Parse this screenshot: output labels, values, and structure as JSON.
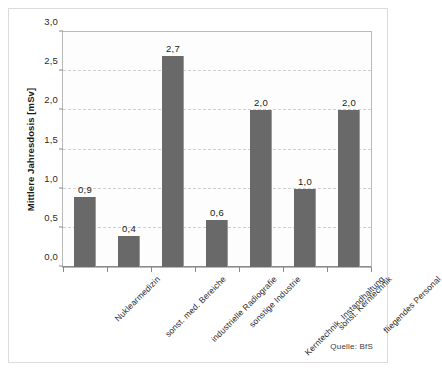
{
  "chart_data": {
    "type": "bar",
    "title": "",
    "xlabel": "",
    "ylabel": "Mittlere Jahresdosis [mSv]",
    "ylim": [
      0,
      3.0
    ],
    "ytick_step": 0.5,
    "ytick_labels": [
      "0,0",
      "0,5",
      "1,0",
      "1,5",
      "2,0",
      "2,5",
      "3,0"
    ],
    "ytick_values": [
      0,
      0.5,
      1.0,
      1.5,
      2.0,
      2.5,
      3.0
    ],
    "grid": "horizontal-dashed",
    "legend": "none",
    "decimal_separator": ",",
    "bar_color": "#696969",
    "categories": [
      "Nuklearmedizin",
      "sonst. med. Bereiche",
      "industrielle Radiografie",
      "sonstige Industrie",
      "Kerntechnik, Instandhaltung",
      "sonst. Kerntechnik",
      "fliegendes Personal"
    ],
    "values": [
      0.9,
      0.4,
      2.7,
      0.6,
      2.0,
      1.0,
      2.0
    ],
    "value_labels": [
      "0,9",
      "0,4",
      "2,7",
      "0,6",
      "2,0",
      "1,0",
      "2,0"
    ]
  },
  "annotations": {
    "source": "Quelle: BfS"
  }
}
